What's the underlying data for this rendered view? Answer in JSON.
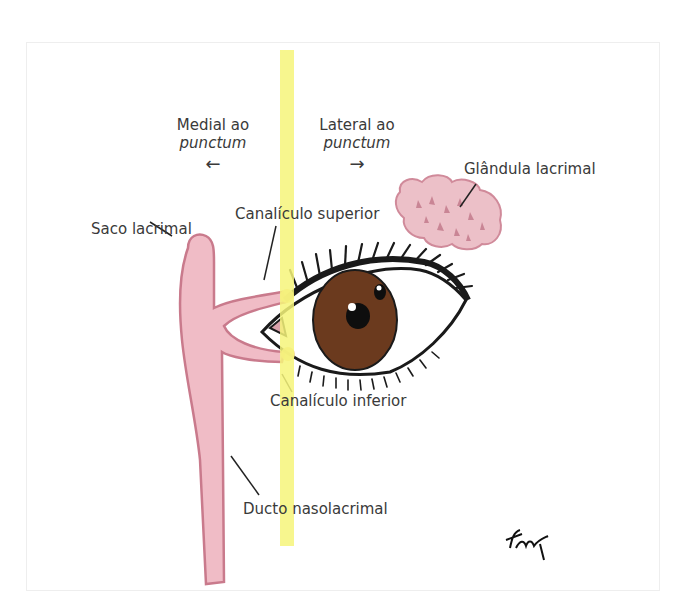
{
  "figure": {
    "direction_labels": {
      "medial": {
        "line1": "Medial ao",
        "line2": "punctum",
        "arrow": "←"
      },
      "lateral": {
        "line1": "Lateral ao",
        "line2": "punctum",
        "arrow": "→"
      }
    },
    "labels": {
      "lacrimal_gland": "Glândula lacrimal",
      "superior_canaliculus": "Canalículo superior",
      "lacrimal_sac": "Saco lacrimal",
      "inferior_canaliculus": "Canalículo inferior",
      "nasolacrimal_duct": "Ducto nasolacrimal"
    },
    "colors": {
      "highlight_line": "#f6f57a",
      "lacrimal_tissue": "#f0bcc6",
      "lacrimal_outline": "#c97a8c",
      "iris": "#6b3a1e",
      "outline": "#1a1a1a",
      "label_text": "#3a3a3a"
    }
  }
}
